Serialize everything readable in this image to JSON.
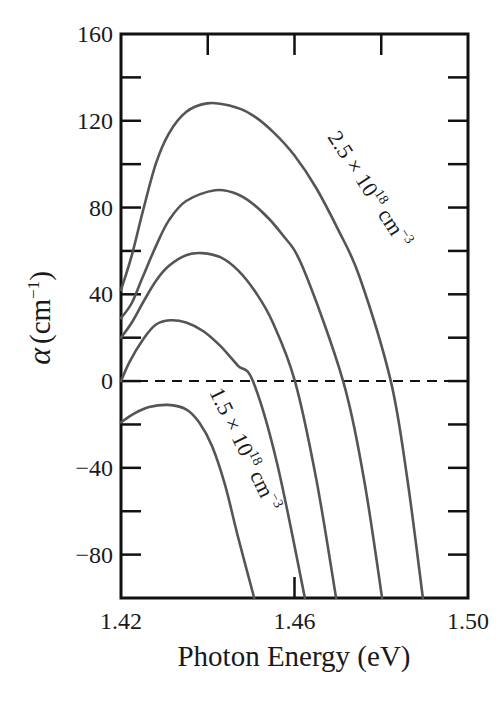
{
  "chart_data": {
    "type": "line",
    "title": "",
    "xlabel": "Photon Energy (eV)",
    "ylabel": "α (cm⁻¹)",
    "ylabel_parts": {
      "symbol": "α",
      "open": "(cm",
      "sup": "−1",
      "close": ")"
    },
    "xlim": [
      1.42,
      1.5
    ],
    "ylim": [
      -100,
      160
    ],
    "x_ticks": [
      1.42,
      1.44,
      1.46,
      1.48,
      1.5
    ],
    "x_tick_labels": [
      {
        "value": 1.42,
        "label": "1.42"
      },
      {
        "value": 1.46,
        "label": "1.46"
      },
      {
        "value": 1.5,
        "label": "1.50"
      }
    ],
    "y_ticks": [
      -100,
      -80,
      -60,
      -40,
      -20,
      0,
      20,
      40,
      60,
      80,
      100,
      120,
      140,
      160
    ],
    "y_tick_labels": [
      {
        "value": -80,
        "label": "−80"
      },
      {
        "value": -40,
        "label": "40"
      },
      {
        "value": 0,
        "label": "0"
      },
      {
        "value": 40,
        "label": "40"
      },
      {
        "value": 80,
        "label": "80"
      },
      {
        "value": 120,
        "label": "120"
      },
      {
        "value": 160,
        "label": "160"
      }
    ],
    "grid": false,
    "legend": null,
    "reference_line": {
      "y": 0,
      "style": "dashed"
    },
    "series": [
      {
        "name": "2.5 × 10^18 cm^-3",
        "x": [
          1.42,
          1.4225,
          1.425,
          1.428,
          1.431,
          1.435,
          1.4398,
          1.445,
          1.45,
          1.455,
          1.46,
          1.465,
          1.47,
          1.475,
          1.4822,
          1.486,
          1.4896
        ],
        "y": [
          42,
          58,
          78,
          100,
          114,
          124,
          128,
          127,
          123,
          115,
          104,
          89,
          70,
          48,
          0,
          -45,
          -100
        ]
      },
      {
        "name": "curve-2",
        "x": [
          1.42,
          1.4225,
          1.425,
          1.428,
          1.431,
          1.435,
          1.4417,
          1.447,
          1.452,
          1.457,
          1.462,
          1.4712,
          1.476,
          1.4802
        ],
        "y": [
          29,
          36,
          48,
          62,
          74,
          83,
          88,
          86,
          79,
          68,
          52,
          0,
          -45,
          -100
        ]
      },
      {
        "name": "curve-3",
        "x": [
          1.42,
          1.4225,
          1.425,
          1.428,
          1.431,
          1.435,
          1.4387,
          1.443,
          1.447,
          1.451,
          1.455,
          1.4601,
          1.465,
          1.4696
        ],
        "y": [
          20,
          27,
          36,
          46,
          53,
          58,
          59,
          57,
          51,
          41,
          27,
          0,
          -45,
          -100
        ]
      },
      {
        "name": "curve-4",
        "x": [
          1.42,
          1.422,
          1.425,
          1.428,
          1.4313,
          1.435,
          1.439,
          1.443,
          1.447,
          1.4504,
          1.456,
          1.4624
        ],
        "y": [
          0,
          9,
          19,
          26,
          28,
          27,
          23,
          16,
          7,
          0,
          -38,
          -100
        ]
      },
      {
        "name": "1.5 × 10^18 cm^-3",
        "x": [
          1.42,
          1.423,
          1.4265,
          1.4308,
          1.435,
          1.438,
          1.441,
          1.444,
          1.447,
          1.4507
        ],
        "y": [
          -19,
          -15,
          -12,
          -11,
          -13,
          -19,
          -30,
          -48,
          -72,
          -100
        ]
      }
    ],
    "annotations": [
      {
        "series": "2.5 × 10^18 cm^-3",
        "text_main": "2.5 × 10",
        "sup1": "18",
        "text_unit": " cm",
        "sup2": "−3"
      },
      {
        "series": "1.5 × 10^18 cm^-3",
        "text_main": "1.5 × 10",
        "sup1": "18",
        "text_unit": " cm",
        "sup2": "−3"
      }
    ]
  },
  "style": {
    "curve_color": "#555555",
    "axis_color": "#111111",
    "background": "#ffffff"
  }
}
